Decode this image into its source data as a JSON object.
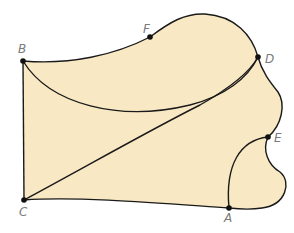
{
  "diagram": {
    "fill_color": "#f9e8c4",
    "stroke_color": "#1a1a1a",
    "label_color": "#7a7a7a",
    "points": [
      {
        "id": "A",
        "label": "A"
      },
      {
        "id": "B",
        "label": "B"
      },
      {
        "id": "C",
        "label": "C"
      },
      {
        "id": "D",
        "label": "D"
      },
      {
        "id": "E",
        "label": "E"
      },
      {
        "id": "F",
        "label": "F"
      }
    ],
    "edges": [
      {
        "from": "B",
        "to": "F",
        "type": "curve"
      },
      {
        "from": "F",
        "to": "D",
        "type": "curve"
      },
      {
        "from": "D",
        "to": "E",
        "type": "curve"
      },
      {
        "from": "E",
        "to": "A",
        "type": "curve"
      },
      {
        "from": "A",
        "to": "C",
        "type": "curve"
      },
      {
        "from": "C",
        "to": "B",
        "type": "straight"
      },
      {
        "from": "B",
        "to": "D",
        "type": "curve"
      },
      {
        "from": "C",
        "to": "D",
        "type": "curve"
      },
      {
        "from": "E",
        "to": "A",
        "type": "outer-curve"
      }
    ]
  }
}
